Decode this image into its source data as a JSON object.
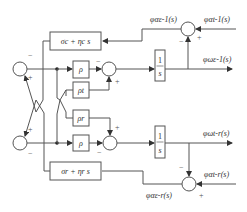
{
  "diagram": {
    "type": "block-diagram",
    "blocks": {
      "sigma_top": "σc + ηc s",
      "sigma_bottom": "σr + ηr s",
      "rho_top": "ρ",
      "rho_t": "ρt",
      "rho_r": "ρr",
      "rho_bottom": "ρ",
      "integrator_top_num": "1",
      "integrator_top_den": "s",
      "integrator_bottom_num": "1",
      "integrator_bottom_den": "s"
    },
    "signals": {
      "top_error": "φαε-1(s)",
      "top_reference": "φαt-1(s)",
      "top_output": "φωε-1(s)",
      "bottom_output": "φωt-r(s)",
      "bottom_reference": "φαt-r(s)",
      "bottom_error": "φαε-r(s)"
    },
    "signs": {
      "plus": "+",
      "minus": "−"
    }
  }
}
